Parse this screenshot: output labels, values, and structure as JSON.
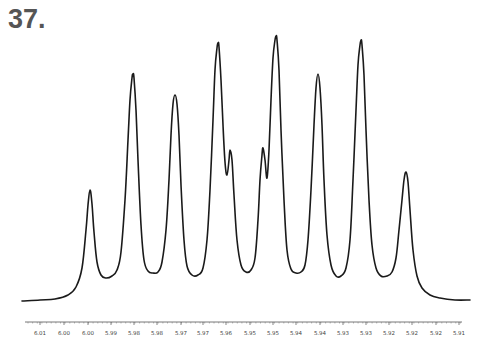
{
  "figure": {
    "label": "37."
  },
  "chart_data": {
    "type": "line",
    "title": "37.",
    "subtitle": "1H NMR spectrum multiplet",
    "xlabel": "",
    "ylabel": "",
    "x_axis_reversed": true,
    "xlim": [
      6.015,
      5.905
    ],
    "grid": false,
    "legend": null,
    "tick_labels": [
      "6.01",
      "6.00",
      "6.00",
      "5.99",
      "5.98",
      "5.98",
      "5.97",
      "5.97",
      "5.96",
      "5.95",
      "5.95",
      "5.94",
      "5.94",
      "5.93",
      "5.93",
      "5.92",
      "5.92",
      "5.92",
      "5.91"
    ],
    "tick_label_x_px": [
      40,
      64,
      88,
      111,
      134,
      157,
      181,
      203,
      226,
      250,
      273,
      296,
      320,
      343,
      366,
      389,
      412,
      436,
      459
    ],
    "peaks": [
      {
        "index": 1,
        "x_px": 90,
        "relative_height": 0.42
      },
      {
        "index": 2,
        "x_px": 133,
        "relative_height": 0.86
      },
      {
        "index": 3,
        "x_px": 175,
        "relative_height": 0.78
      },
      {
        "index": 4,
        "x_px": 218,
        "relative_height": 0.97
      },
      {
        "index": 5,
        "x_px": 230,
        "relative_height": 0.57,
        "note": "shoulder"
      },
      {
        "index": 6,
        "x_px": 263,
        "relative_height": 0.57,
        "note": "shoulder"
      },
      {
        "index": 7,
        "x_px": 276,
        "relative_height": 1.0
      },
      {
        "index": 8,
        "x_px": 318,
        "relative_height": 0.86
      },
      {
        "index": 9,
        "x_px": 361,
        "relative_height": 0.98
      },
      {
        "index": 10,
        "x_px": 406,
        "relative_height": 0.48
      }
    ],
    "series": [
      {
        "name": "spectrum",
        "color": "#1a1a1a",
        "path_px": [
          [
            22,
            301
          ],
          [
            40,
            300
          ],
          [
            55,
            299
          ],
          [
            68,
            295
          ],
          [
            76,
            287
          ],
          [
            82,
            268
          ],
          [
            86,
            230
          ],
          [
            88,
            205
          ],
          [
            90,
            190
          ],
          [
            92,
            204
          ],
          [
            94,
            232
          ],
          [
            97,
            262
          ],
          [
            101,
            275
          ],
          [
            106,
            278
          ],
          [
            112,
            276
          ],
          [
            117,
            270
          ],
          [
            121,
            252
          ],
          [
            125,
            200
          ],
          [
            128,
            140
          ],
          [
            130,
            100
          ],
          [
            132,
            78
          ],
          [
            133,
            74
          ],
          [
            134,
            78
          ],
          [
            136,
            110
          ],
          [
            138,
            160
          ],
          [
            141,
            225
          ],
          [
            144,
            260
          ],
          [
            148,
            271
          ],
          [
            153,
            273
          ],
          [
            158,
            272
          ],
          [
            162,
            262
          ],
          [
            166,
            230
          ],
          [
            169,
            180
          ],
          [
            171,
            135
          ],
          [
            173,
            104
          ],
          [
            175,
            95
          ],
          [
            177,
            104
          ],
          [
            179,
            135
          ],
          [
            181,
            185
          ],
          [
            184,
            240
          ],
          [
            187,
            266
          ],
          [
            192,
            275
          ],
          [
            198,
            275
          ],
          [
            203,
            268
          ],
          [
            207,
            240
          ],
          [
            210,
            190
          ],
          [
            213,
            120
          ],
          [
            215,
            70
          ],
          [
            217,
            48
          ],
          [
            218,
            43
          ],
          [
            219,
            47
          ],
          [
            221,
            80
          ],
          [
            223,
            125
          ],
          [
            225,
            162
          ],
          [
            227,
            175
          ],
          [
            229,
            160
          ],
          [
            230,
            150
          ],
          [
            232,
            160
          ],
          [
            234,
            195
          ],
          [
            237,
            240
          ],
          [
            241,
            265
          ],
          [
            246,
            272
          ],
          [
            251,
            270
          ],
          [
            255,
            258
          ],
          [
            258,
            220
          ],
          [
            260,
            180
          ],
          [
            262,
            155
          ],
          [
            263,
            148
          ],
          [
            265,
            160
          ],
          [
            267,
            178
          ],
          [
            269,
            150
          ],
          [
            271,
            100
          ],
          [
            273,
            58
          ],
          [
            275,
            40
          ],
          [
            276,
            36
          ],
          [
            277,
            40
          ],
          [
            279,
            70
          ],
          [
            281,
            130
          ],
          [
            284,
            200
          ],
          [
            287,
            250
          ],
          [
            291,
            269
          ],
          [
            296,
            273
          ],
          [
            301,
            272
          ],
          [
            305,
            265
          ],
          [
            308,
            240
          ],
          [
            311,
            190
          ],
          [
            314,
            125
          ],
          [
            316,
            88
          ],
          [
            318,
            74
          ],
          [
            320,
            88
          ],
          [
            322,
            125
          ],
          [
            324,
            180
          ],
          [
            327,
            235
          ],
          [
            331,
            265
          ],
          [
            336,
            276
          ],
          [
            341,
            276
          ],
          [
            346,
            268
          ],
          [
            350,
            240
          ],
          [
            353,
            180
          ],
          [
            356,
            110
          ],
          [
            358,
            65
          ],
          [
            360,
            45
          ],
          [
            361,
            40
          ],
          [
            362,
            45
          ],
          [
            364,
            75
          ],
          [
            366,
            130
          ],
          [
            369,
            200
          ],
          [
            372,
            245
          ],
          [
            376,
            268
          ],
          [
            381,
            276
          ],
          [
            387,
            276
          ],
          [
            392,
            272
          ],
          [
            396,
            258
          ],
          [
            399,
            230
          ],
          [
            402,
            200
          ],
          [
            404,
            180
          ],
          [
            406,
            172
          ],
          [
            408,
            182
          ],
          [
            410,
            210
          ],
          [
            413,
            250
          ],
          [
            417,
            276
          ],
          [
            422,
            288
          ],
          [
            430,
            295
          ],
          [
            440,
            298
          ],
          [
            455,
            300
          ],
          [
            470,
            300
          ]
        ]
      }
    ],
    "axis": {
      "y_px": 322,
      "x_start_px": 25,
      "x_end_px": 462
    }
  }
}
